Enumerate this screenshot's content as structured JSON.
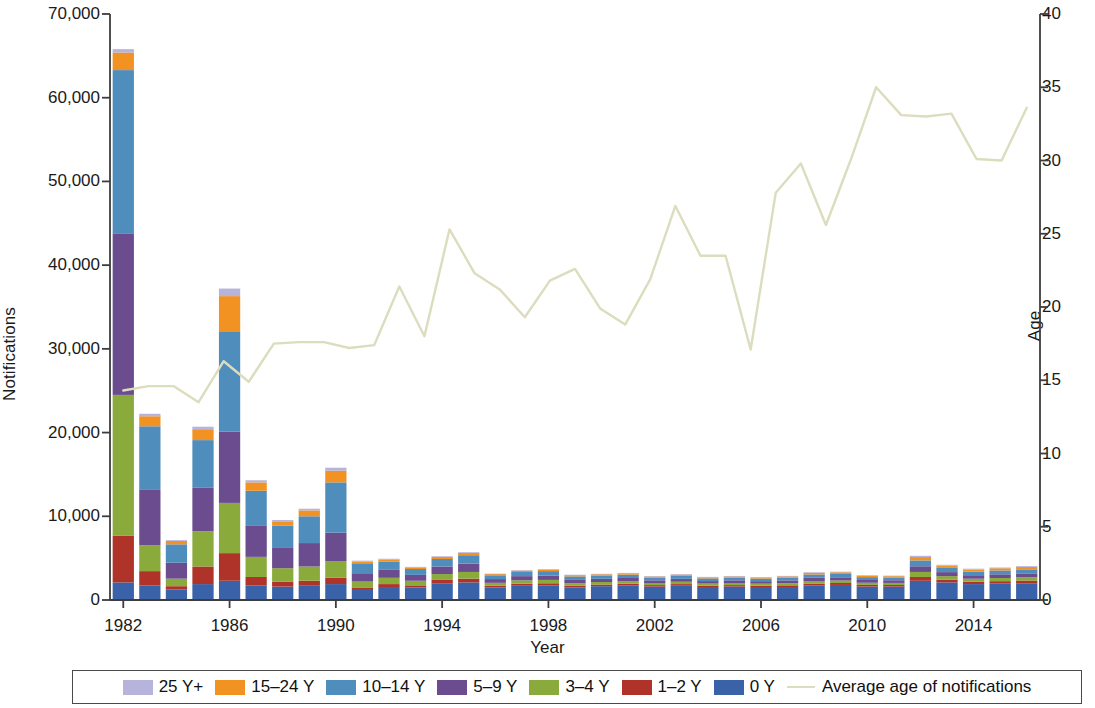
{
  "chart_data": {
    "type": "bar",
    "stacked": true,
    "title": "",
    "xlabel": "Year",
    "ylabel": "Notifications",
    "ylabel_secondary": "Age",
    "ylim": [
      0,
      70000
    ],
    "ylim_secondary": [
      0,
      40
    ],
    "grid": false,
    "legend_position": "bottom",
    "y_ticks": [
      "0",
      "10,000",
      "20,000",
      "30,000",
      "40,000",
      "50,000",
      "60,000",
      "70,000"
    ],
    "y_tick_values": [
      0,
      10000,
      20000,
      30000,
      40000,
      50000,
      60000,
      70000
    ],
    "y_ticks_secondary": [
      "0",
      "5",
      "10",
      "15",
      "20",
      "25",
      "30",
      "35",
      "40"
    ],
    "y_tick_values_secondary": [
      0,
      5,
      10,
      15,
      20,
      25,
      30,
      35,
      40
    ],
    "x_tick_labels": [
      "1982",
      "1986",
      "1990",
      "1994",
      "1998",
      "2002",
      "2006",
      "2010",
      "2014"
    ],
    "x_tick_values": [
      1982,
      1986,
      1990,
      1994,
      1998,
      2002,
      2006,
      2010,
      2014
    ],
    "categories": [
      1982,
      1983,
      1984,
      1985,
      1986,
      1987,
      1988,
      1989,
      1990,
      1991,
      1992,
      1993,
      1994,
      1995,
      1996,
      1997,
      1998,
      1999,
      2000,
      2001,
      2002,
      2003,
      2004,
      2005,
      2006,
      2007,
      2008,
      2009,
      2010,
      2011,
      2012,
      2013,
      2014,
      2015,
      2016
    ],
    "series": [
      {
        "name": "0 Y",
        "color": "#3a62a8",
        "values": [
          2100,
          1750,
          1250,
          1900,
          2300,
          1750,
          1600,
          1700,
          1900,
          1200,
          1550,
          1500,
          2000,
          2100,
          1500,
          1700,
          1750,
          1500,
          1650,
          1750,
          1600,
          1700,
          1550,
          1600,
          1550,
          1550,
          1750,
          1800,
          1600,
          1600,
          2300,
          2100,
          1900,
          1950,
          2000
        ]
      },
      {
        "name": "1–2 Y",
        "color": "#b0332a",
        "values": [
          5600,
          1700,
          400,
          2100,
          3300,
          1000,
          600,
          600,
          750,
          300,
          350,
          250,
          400,
          450,
          200,
          250,
          250,
          200,
          200,
          200,
          180,
          200,
          170,
          180,
          170,
          200,
          220,
          230,
          200,
          190,
          450,
          330,
          280,
          300,
          320
        ]
      },
      {
        "name": "3–4 Y",
        "color": "#8aaa3c",
        "values": [
          16800,
          3100,
          900,
          4200,
          6000,
          2400,
          1600,
          1700,
          2000,
          700,
          750,
          550,
          700,
          800,
          350,
          400,
          400,
          300,
          300,
          300,
          250,
          280,
          240,
          250,
          230,
          260,
          300,
          300,
          260,
          250,
          600,
          420,
          360,
          380,
          400
        ]
      },
      {
        "name": "5–9 Y",
        "color": "#6b4c8f",
        "values": [
          19300,
          6600,
          1900,
          5200,
          8500,
          3700,
          2500,
          2800,
          3400,
          1000,
          950,
          700,
          900,
          1000,
          450,
          500,
          500,
          400,
          380,
          380,
          320,
          350,
          300,
          320,
          300,
          330,
          380,
          380,
          330,
          320,
          680,
          480,
          420,
          440,
          460
        ]
      },
      {
        "name": "10–14 Y",
        "color": "#4f8dbd",
        "values": [
          19500,
          7600,
          2200,
          5700,
          12000,
          4200,
          2600,
          3200,
          6000,
          1100,
          1000,
          700,
          900,
          1000,
          450,
          500,
          550,
          420,
          400,
          400,
          330,
          360,
          320,
          330,
          310,
          340,
          400,
          400,
          340,
          330,
          700,
          500,
          440,
          460,
          480
        ]
      },
      {
        "name": "15–24 Y",
        "color": "#f29222",
        "values": [
          2100,
          1200,
          400,
          1300,
          4200,
          1000,
          500,
          700,
          1400,
          300,
          250,
          200,
          250,
          280,
          150,
          160,
          180,
          150,
          150,
          160,
          130,
          150,
          130,
          140,
          130,
          150,
          200,
          200,
          170,
          160,
          400,
          280,
          250,
          260,
          280
        ]
      },
      {
        "name": "25 Y+",
        "color": "#b6b3dc",
        "values": [
          400,
          300,
          100,
          300,
          900,
          250,
          150,
          200,
          350,
          100,
          80,
          60,
          80,
          90,
          50,
          50,
          60,
          50,
          50,
          50,
          50,
          50,
          50,
          50,
          50,
          50,
          70,
          70,
          60,
          60,
          150,
          100,
          90,
          90,
          100
        ]
      }
    ],
    "line_series": {
      "name": "Average age of notifications",
      "color": "#dcdcbe",
      "axis": "secondary",
      "values": [
        14.3,
        14.6,
        14.6,
        13.5,
        16.3,
        14.9,
        17.5,
        17.6,
        17.6,
        17.2,
        17.4,
        21.4,
        18.0,
        25.3,
        22.3,
        21.2,
        19.3,
        21.8,
        22.6,
        19.9,
        18.8,
        21.9,
        26.9,
        23.5,
        23.5,
        17.1,
        27.8,
        29.8,
        25.6,
        30.1,
        35.0,
        33.1,
        33.0,
        33.2,
        30.1,
        30.0,
        33.6
      ]
    }
  },
  "legend": {
    "items": [
      {
        "label": "25 Y+",
        "color": "#b6b3dc",
        "kind": "swatch"
      },
      {
        "label": "15–24 Y",
        "color": "#f29222",
        "kind": "swatch"
      },
      {
        "label": "10–14 Y",
        "color": "#4f8dbd",
        "kind": "swatch"
      },
      {
        "label": "5–9 Y",
        "color": "#6b4c8f",
        "kind": "swatch"
      },
      {
        "label": "3–4 Y",
        "color": "#8aaa3c",
        "kind": "swatch"
      },
      {
        "label": "1–2 Y",
        "color": "#b0332a",
        "kind": "swatch"
      },
      {
        "label": "0 Y",
        "color": "#3a62a8",
        "kind": "swatch"
      },
      {
        "label": "Average age of notifications",
        "color": "#dcdcbe",
        "kind": "line"
      }
    ]
  },
  "axes": {
    "left_title": "Notifications",
    "right_title": "Age",
    "bottom_title": "Year"
  }
}
